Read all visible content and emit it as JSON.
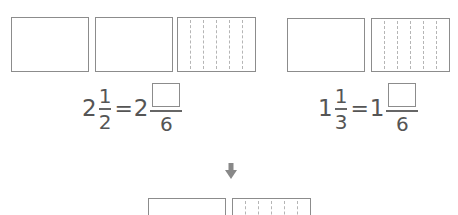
{
  "top_left_model": {
    "boxes": [
      {
        "divisions": 1
      },
      {
        "divisions": 1
      },
      {
        "divisions": 6
      }
    ]
  },
  "top_right_model": {
    "boxes": [
      {
        "divisions": 1
      },
      {
        "divisions": 6
      }
    ]
  },
  "equation_left": {
    "whole": "2",
    "numerator": "1",
    "denominator": "2",
    "equals": "=",
    "result_whole": "2",
    "result_numerator": "",
    "result_denominator": "6"
  },
  "equation_right": {
    "whole": "1",
    "numerator": "1",
    "denominator": "3",
    "equals": "=",
    "result_whole": "1",
    "result_numerator": "",
    "result_denominator": "6"
  },
  "arrow": {
    "icon": "down-arrow-icon",
    "color": "#888888"
  },
  "bottom_model": {
    "boxes": [
      {
        "divisions": 1
      },
      {
        "divisions": 6
      }
    ]
  },
  "colors": {
    "box_border": "#8c8c8c",
    "dashed_line": "#b5b5b5",
    "text": "#555555"
  }
}
